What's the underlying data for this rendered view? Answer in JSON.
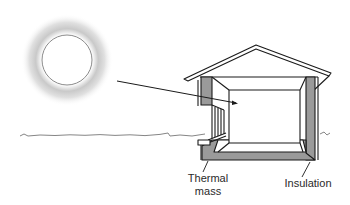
{
  "diagram": {
    "elements": {
      "sun": "sun-icon",
      "sunlight_ray": "sunlight-arrow",
      "ground": "ground-line",
      "house": "house-cross-section"
    },
    "labels": {
      "thermal_mass_line1": "Thermal",
      "thermal_mass_line2": "mass",
      "insulation": "Insulation"
    },
    "colors": {
      "line": "#1a1a1a",
      "wall_fill": "#9a9a9a",
      "sun_glow": "#c8c8c8",
      "background": "#ffffff"
    }
  }
}
